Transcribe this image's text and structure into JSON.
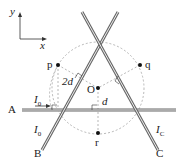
{
  "diagram": {
    "axes": {
      "y_label": "y",
      "x_label": "x"
    },
    "wires": [
      {
        "name": "A",
        "label": "A",
        "current_label": "I",
        "current_sub": "0"
      },
      {
        "name": "B",
        "label": "B",
        "current_label": "I",
        "current_sub": "0"
      },
      {
        "name": "C",
        "label": "C",
        "current_label": "I",
        "current_sub": "C"
      }
    ],
    "points": {
      "p": "p",
      "q": "q",
      "r": "r",
      "O": "O"
    },
    "distances": {
      "p_to_A": "2d",
      "O_to_A": "d"
    },
    "colors": {
      "wire": "#777777",
      "line": "#333333",
      "dashed": "#888888"
    }
  }
}
